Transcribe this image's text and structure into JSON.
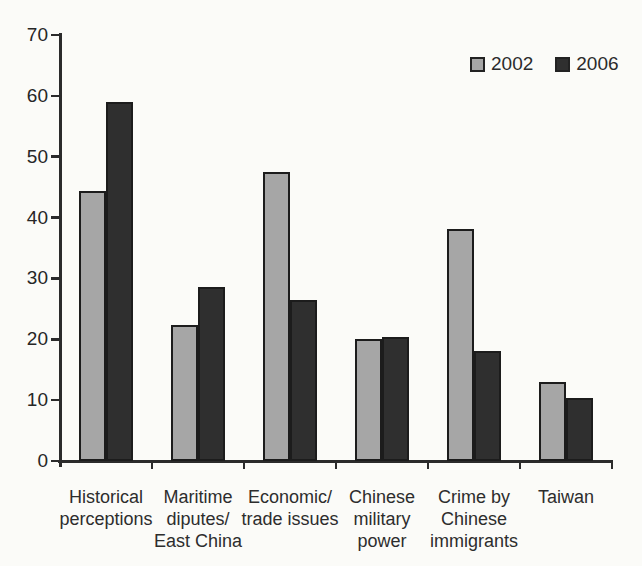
{
  "chart_data": {
    "type": "bar",
    "title": "",
    "xlabel": "",
    "ylabel": "",
    "grid": false,
    "legend_position": "top-right",
    "ylim": [
      0,
      70
    ],
    "yticks": [
      0,
      10,
      20,
      30,
      40,
      50,
      60,
      70
    ],
    "categories": [
      {
        "label": "Historical perceptions",
        "lines": [
          "Historical",
          "perceptions"
        ]
      },
      {
        "label": "Maritime diputes/ East China",
        "lines": [
          "Maritime",
          "diputes/",
          "East China"
        ]
      },
      {
        "label": "Economic/ trade issues",
        "lines": [
          "Economic/",
          "trade issues"
        ]
      },
      {
        "label": "Chinese military power",
        "lines": [
          "Chinese",
          "military",
          "power"
        ]
      },
      {
        "label": "Crime by Chinese immigrants",
        "lines": [
          "Crime by",
          "Chinese",
          "immigrants"
        ]
      },
      {
        "label": "Taiwan",
        "lines": [
          "Taiwan"
        ]
      }
    ],
    "series": [
      {
        "name": "2002",
        "color": "#a6a6a6",
        "values": [
          44.3,
          22.4,
          47.5,
          20.1,
          38.2,
          12.9
        ]
      },
      {
        "name": "2006",
        "color": "#2f2f2f",
        "values": [
          59.0,
          28.6,
          26.5,
          20.4,
          18.0,
          10.3
        ]
      }
    ]
  },
  "legend": {
    "items": [
      {
        "label": "2002",
        "swatch": "#a6a6a6"
      },
      {
        "label": "2006",
        "swatch": "#2f2f2f"
      }
    ]
  },
  "colors": {
    "background": "#fbfbf8",
    "axis": "#2b2b2b",
    "bar_border": "#1c1c1c",
    "text": "#2d2d2d"
  }
}
